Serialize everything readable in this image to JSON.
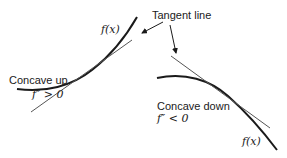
{
  "diagram": {
    "colors": {
      "curve": "#1a1a1a",
      "tangent": "#555555",
      "text": "#1a1a1a",
      "background": "#ffffff"
    },
    "callout": {
      "label": "Tangent line"
    },
    "left_panel": {
      "curve_label": "f(x)",
      "concavity_label": "Concave up",
      "condition_label": "f″ > 0"
    },
    "right_panel": {
      "curve_label": "f(x)",
      "concavity_label": "Concave down",
      "condition_label": "f″ < 0"
    }
  }
}
